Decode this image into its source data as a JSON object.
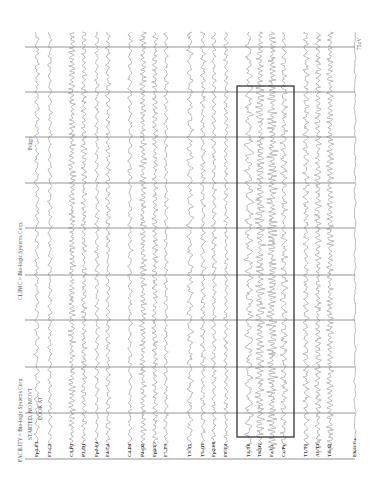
{
  "header": {
    "facility": "FACILITY = Bio-logic Systems Corp.",
    "state": "STARTED, NO MOVT",
    "instruction": "LOOK AT",
    "clinic": "CLINIC = Bio-logic Systems Corp.",
    "annotation": "Fdign",
    "calibration": "75uV"
  },
  "colors": {
    "trace": "#8a8a8a",
    "grid": "#7a7a7a",
    "highlight_box": "#333333",
    "background": "#ffffff"
  },
  "grid": {
    "time_lines_y": [
      47,
      92,
      137,
      183,
      228,
      275,
      320,
      367,
      413
    ],
    "x_start": 25,
    "x_end": 355,
    "baseline_y": 459
  },
  "highlight_box": {
    "x": 237,
    "y": 86,
    "width": 57,
    "height": 351
  },
  "channels": [
    {
      "label": "Fp1-F3",
      "x": 37,
      "amp": 2.2,
      "freq": 0.55
    },
    {
      "label": "F3-C3",
      "x": 50,
      "amp": 2.0,
      "freq": 0.6
    },
    {
      "label": "C3-P3",
      "x": 72,
      "amp": 3.2,
      "freq": 1.4
    },
    {
      "label": "P3-O1",
      "x": 84,
      "amp": 2.6,
      "freq": 1.1
    },
    {
      "label": "Fp2-F4",
      "x": 97,
      "amp": 2.0,
      "freq": 0.7
    },
    {
      "label": "F4-C4",
      "x": 108,
      "amp": 2.4,
      "freq": 0.8
    },
    {
      "label": "C4-P4",
      "x": 130,
      "amp": 2.2,
      "freq": 0.6
    },
    {
      "label": "P4-O2",
      "x": 143,
      "amp": 3.0,
      "freq": 1.3
    },
    {
      "label": "Fp1-F7",
      "x": 155,
      "amp": 2.6,
      "freq": 1.1
    },
    {
      "label": "F7-T3",
      "x": 166,
      "amp": 2.0,
      "freq": 0.7
    },
    {
      "label": "T3-T5",
      "x": 190,
      "amp": 3.0,
      "freq": 0.5
    },
    {
      "label": "T5-O1",
      "x": 203,
      "amp": 2.4,
      "freq": 0.7
    },
    {
      "label": "Fp2-F8",
      "x": 214,
      "amp": 2.2,
      "freq": 0.8
    },
    {
      "label": "F8-T4",
      "x": 226,
      "amp": 2.0,
      "freq": 0.9
    },
    {
      "label": "T4-T6",
      "x": 249,
      "amp": 3.0,
      "freq": 0.5
    },
    {
      "label": "T6-O2",
      "x": 260,
      "amp": 3.4,
      "freq": 1.3
    },
    {
      "label": "Fz-Cz",
      "x": 272,
      "amp": 3.6,
      "freq": 1.5
    },
    {
      "label": "Cz-Pz",
      "x": 284,
      "amp": 2.4,
      "freq": 0.8
    },
    {
      "label": "T1-T2",
      "x": 306,
      "amp": 2.8,
      "freq": 0.8
    },
    {
      "label": "A1-T3",
      "x": 318,
      "amp": 3.0,
      "freq": 1.1
    },
    {
      "label": "T4-A2",
      "x": 330,
      "amp": 3.2,
      "freq": 1.3
    },
    {
      "label": "EKG-Cz",
      "x": 355,
      "amp": 1.0,
      "freq": 0.3
    }
  ]
}
